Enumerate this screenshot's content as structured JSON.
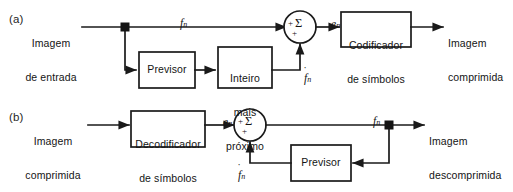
{
  "figure": {
    "background_color": "#ffffff",
    "line_color": "#1a1a1a",
    "panels": [
      {
        "tag": "(a)",
        "name": "encoder-predictive-coding",
        "io": {
          "input_line1": "Imagem",
          "input_line2": "de entrada",
          "output_line1": "Imagem",
          "output_line2": "comprimida"
        },
        "boxes": [
          {
            "id": "previsor",
            "line1": "Previsor",
            "line2": ""
          },
          {
            "id": "inteiro-mais-proximo",
            "line1": "Inteiro",
            "line2": "mais",
            "line3": "próximo"
          },
          {
            "id": "codificador-de-simbolos",
            "line1": "Codificador",
            "line2": "de símbolos"
          }
        ],
        "summer": {
          "sigma": "Σ",
          "sign_top": "+",
          "sign_bottom": "+"
        },
        "signals": [
          {
            "id": "fn-input",
            "base": "f",
            "sub": "n",
            "hat": false
          },
          {
            "id": "en-error",
            "base": "e",
            "sub": "n",
            "hat": false
          },
          {
            "id": "fn-hat-prediction",
            "base": "f",
            "sub": "n",
            "hat": true
          }
        ]
      },
      {
        "tag": "(b)",
        "name": "decoder-predictive-coding",
        "io": {
          "input_line1": "Imagem",
          "input_line2": "comprimida",
          "output_line1": "Imagem",
          "output_line2": "descomprimida"
        },
        "boxes": [
          {
            "id": "decodificador-de-simbolos",
            "line1": "Decodificador",
            "line2": "de símbolos"
          },
          {
            "id": "previsor",
            "line1": "Previsor",
            "line2": ""
          }
        ],
        "summer": {
          "sigma": "Σ",
          "sign_top": "+",
          "sign_bottom": "+"
        },
        "signals": [
          {
            "id": "en-error",
            "base": "e",
            "sub": "n",
            "hat": false
          },
          {
            "id": "fn-hat-prediction",
            "base": "f",
            "sub": "n",
            "hat": true
          },
          {
            "id": "fn-output",
            "base": "f",
            "sub": "n",
            "hat": false
          }
        ]
      }
    ]
  }
}
